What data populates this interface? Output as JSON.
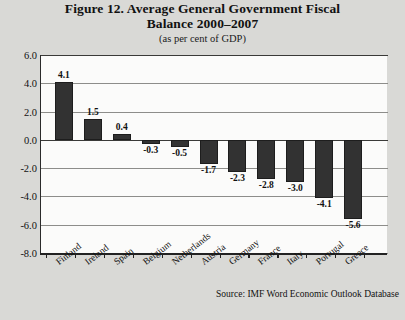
{
  "chart_data": {
    "type": "bar",
    "title": "Figure 12. Average General Government Fiscal Balance 2000–2007",
    "title_lines": [
      "Figure 12. Average General Government Fiscal",
      "Balance 2000–2007"
    ],
    "subtitle": "(as per cent of GDP)",
    "xlabel": "",
    "ylabel": "",
    "ylim": [
      -8.0,
      6.0
    ],
    "ytick_labels": [
      "6.0",
      "4.0",
      "2.0",
      "0.0",
      "-2.0",
      "-4.0",
      "-6.0",
      "-8.0"
    ],
    "ytick_values": [
      6.0,
      4.0,
      2.0,
      0.0,
      -2.0,
      -4.0,
      -6.0,
      -8.0
    ],
    "grid": true,
    "legend": false,
    "categories": [
      "Finland",
      "Ireland",
      "Spain",
      "Belgium",
      "Netherlands",
      "Austria",
      "Germany",
      "France",
      "Italy",
      "Portugal",
      "Greece"
    ],
    "values": [
      4.1,
      1.5,
      0.4,
      -0.3,
      -0.5,
      -1.7,
      -2.3,
      -2.8,
      -3.0,
      -4.1,
      -5.6
    ],
    "value_labels": [
      "4.1",
      "1.5",
      "0.4",
      "-0.3",
      "-0.5",
      "-1.7",
      "-2.3",
      "-2.8",
      "-3.0",
      "-4.1",
      "-5.6"
    ],
    "bar_color": "#323232",
    "source": "Source: IMF Word Economic Outlook Database"
  }
}
